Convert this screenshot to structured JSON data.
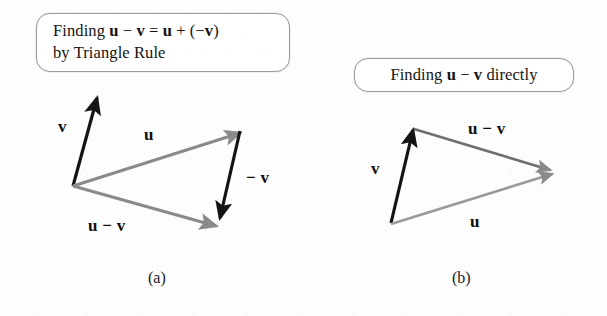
{
  "figure": {
    "width": 607,
    "height": 316,
    "background_color": "#fdfdfd",
    "black_vector_color": "#141414",
    "gray_vector_color": "#8a8a8a",
    "box_border_color": "#9a9a9a"
  },
  "panel_a": {
    "callout_text": "Finding u − v = u + (−v)\nby Triangle Rule",
    "caption": "(a)",
    "vectors": [
      {
        "name": "v",
        "label": "v",
        "color": "black",
        "from": [
          73,
          186
        ],
        "to": [
          97,
          98
        ]
      },
      {
        "name": "u",
        "label": "u",
        "color": "gray",
        "from": [
          73,
          186
        ],
        "to": [
          240,
          133
        ]
      },
      {
        "name": "-v",
        "label": "− v",
        "color": "black",
        "from": [
          240,
          131
        ],
        "to": [
          220,
          218
        ]
      },
      {
        "name": "u-v",
        "label": "u − v",
        "color": "gray",
        "from": [
          73,
          186
        ],
        "to": [
          216,
          226
        ]
      }
    ],
    "labels": [
      {
        "name": "label-v",
        "text": "v",
        "x": 58,
        "y": 117
      },
      {
        "name": "label-u",
        "text": "u",
        "x": 144,
        "y": 125
      },
      {
        "name": "label-neg-v",
        "text": "− v",
        "x": 246,
        "y": 168
      },
      {
        "name": "label-u-v",
        "text": "u − v",
        "x": 88,
        "y": 216
      }
    ]
  },
  "panel_b": {
    "callout_text": "Finding u − v directly",
    "caption": "(b)",
    "vectors": [
      {
        "name": "v",
        "label": "v",
        "color": "black",
        "from": [
          391,
          223
        ],
        "to": [
          413,
          130
        ]
      },
      {
        "name": "u-v",
        "label": "u − v",
        "color": "gray",
        "from": [
          414,
          129
        ],
        "to": [
          550,
          170
        ]
      },
      {
        "name": "u",
        "label": "u",
        "color": "gray",
        "from": [
          391,
          224
        ],
        "to": [
          552,
          174
        ]
      }
    ],
    "labels": [
      {
        "name": "label-v",
        "text": "v",
        "x": 371,
        "y": 159
      },
      {
        "name": "label-u-v",
        "text": "u − v",
        "x": 468,
        "y": 119
      },
      {
        "name": "label-u",
        "text": "u",
        "x": 470,
        "y": 212
      }
    ]
  }
}
